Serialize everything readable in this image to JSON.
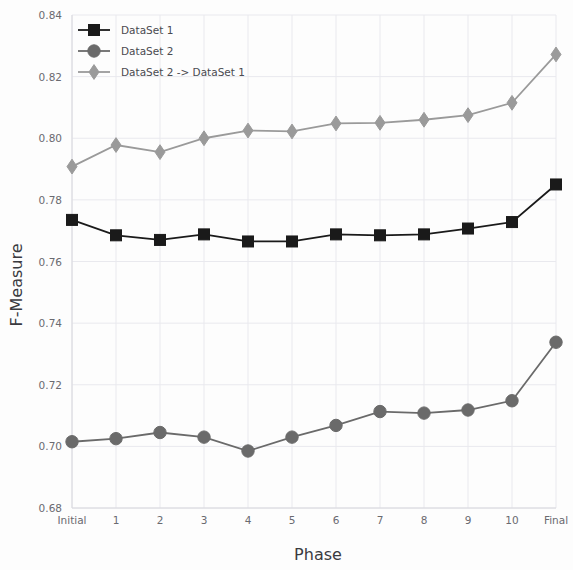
{
  "chart_data": {
    "type": "line",
    "title": "",
    "xlabel": "Phase",
    "ylabel": "F-Measure",
    "categories": [
      "Initial",
      "1",
      "2",
      "3",
      "4",
      "5",
      "6",
      "7",
      "8",
      "9",
      "10",
      "Final"
    ],
    "ylim": [
      0.68,
      0.84
    ],
    "yticks": [
      "0.68",
      "0.70",
      "0.72",
      "0.74",
      "0.76",
      "0.78",
      "0.80",
      "0.82",
      "0.84"
    ],
    "ytick_values": [
      0.68,
      0.7,
      0.72,
      0.74,
      0.76,
      0.78,
      0.8,
      0.82,
      0.84
    ],
    "grid": true,
    "legend_position": "top-left",
    "series": [
      {
        "name": "DataSet 1",
        "color": "#1a1a1a",
        "marker": "square",
        "values": [
          0.7735,
          0.7685,
          0.767,
          0.7688,
          0.7665,
          0.7665,
          0.7688,
          0.7685,
          0.7688,
          0.7707,
          0.7728,
          0.785
        ]
      },
      {
        "name": "DataSet 2",
        "color": "#6a6a6a",
        "marker": "circle",
        "values": [
          0.7015,
          0.7025,
          0.7045,
          0.703,
          0.6985,
          0.703,
          0.7068,
          0.7113,
          0.7108,
          0.7118,
          0.7148,
          0.7338
        ]
      },
      {
        "name": "DataSet 2 -> DataSet 1",
        "color": "#9a9a9a",
        "marker": "diamond",
        "values": [
          0.7908,
          0.7978,
          0.7955,
          0.8,
          0.8025,
          0.8022,
          0.8048,
          0.805,
          0.806,
          0.8075,
          0.8115,
          0.8272
        ]
      }
    ]
  },
  "axes": {
    "x_title": "Phase",
    "y_title": "F-Measure"
  },
  "legend": {
    "items": [
      {
        "label": "DataSet 1"
      },
      {
        "label": "DataSet 2"
      },
      {
        "label": "DataSet 2 -> DataSet 1"
      }
    ]
  }
}
